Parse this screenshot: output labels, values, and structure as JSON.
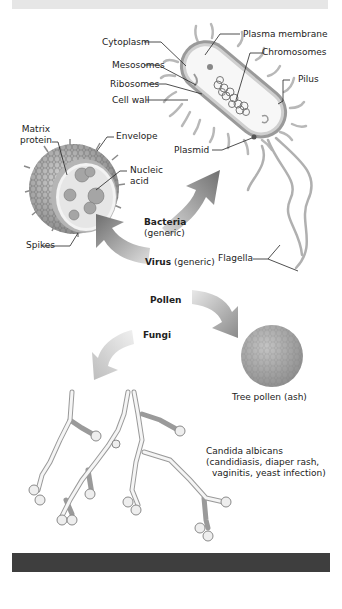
{
  "bacteria": {
    "labels": {
      "cytoplasm": "Cytoplasm",
      "mesosomes": "Mesosomes",
      "ribosomes": "Ribosomes",
      "cell_wall": "Cell wall",
      "plasma_membrane": "Plasma membrane",
      "chromosomes": "Chromosomes",
      "pilus": "Pilus",
      "plasmid": "Plasmid",
      "flagella": "Flagella"
    },
    "caption_bold": "Bacteria",
    "caption_sub": "(generic)"
  },
  "virus": {
    "labels": {
      "matrix_protein_line1": "Matrix",
      "matrix_protein_line2": "protein",
      "envelope": "Envelope",
      "nucleic_acid_line1": "Nucleic",
      "nucleic_acid_line2": "acid",
      "spikes": "Spikes"
    },
    "caption_bold": "Virus",
    "caption_sub": "(generic)"
  },
  "pollen": {
    "caption_bold": "Pollen",
    "label": "Tree pollen (ash)"
  },
  "fungi": {
    "caption_bold": "Fungi",
    "label_line1": "Candida albicans",
    "label_line2": "(candidiasis, diaper rash,",
    "label_line3": "vaginitis, yeast infection)"
  },
  "colors": {
    "arrow_dark": "#7a7a7a",
    "arrow_light": "#c8c8c8",
    "bar_dark": "#3e3e3e",
    "bar_light": "#e6e6e6"
  }
}
